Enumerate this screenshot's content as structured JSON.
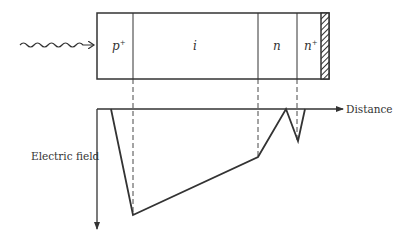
{
  "device": {
    "regions": [
      {
        "id": "p-plus",
        "label": "p",
        "superscript": "+"
      },
      {
        "id": "intrinsic",
        "label": "i",
        "superscript": ""
      },
      {
        "id": "n",
        "label": "n",
        "superscript": ""
      },
      {
        "id": "n-plus",
        "label": "n",
        "superscript": "+"
      }
    ],
    "contact": "hatched metal contact",
    "incident": "wavy arrow (incident light)"
  },
  "plot": {
    "x_axis_label": "Distance",
    "y_axis_label": "Electric field"
  },
  "colors": {
    "line": "#333333",
    "background": "#ffffff"
  }
}
